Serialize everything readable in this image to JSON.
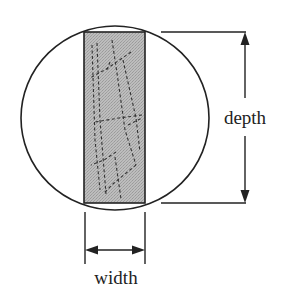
{
  "diagram": {
    "labels": {
      "depth": "depth",
      "width": "width"
    },
    "colors": {
      "stroke": "#222222",
      "section_fill": "#b4b4b4",
      "background": "#ffffff"
    },
    "shapes": {
      "circle": {
        "cx": 115,
        "cy": 118,
        "rx": 94,
        "ry": 92
      },
      "section": {
        "x": 84,
        "y": 32,
        "width": 61,
        "height": 171
      },
      "depth_dimension": {
        "x": 245,
        "y1": 32,
        "y2": 203
      },
      "width_dimension": {
        "y": 250,
        "x1": 84,
        "x2": 145
      }
    }
  }
}
